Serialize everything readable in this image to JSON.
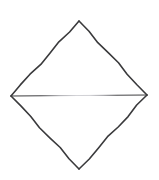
{
  "figure": {
    "shape_name": "rhombus",
    "background_color": "#ffffff",
    "stroke_color_dark": "#3a3a3c",
    "stroke_color_mid": "#8e8e92",
    "stroke_color_light": "#cfcfd3",
    "stroke_width_edge": 1.6,
    "stroke_width_diagonal": 1.2,
    "canvas": {
      "width": 159,
      "height": 180
    },
    "vertices": {
      "top": {
        "label": "top vertex",
        "x": 79,
        "y": 21
      },
      "right": {
        "label": "right vertex",
        "x": 147,
        "y": 95
      },
      "bottom": {
        "label": "bottom vertex",
        "x": 79,
        "y": 169
      },
      "left": {
        "label": "left vertex",
        "x": 11,
        "y": 96
      },
      "center": {
        "label": "diagonal intersection",
        "x": 79,
        "y": 95
      }
    },
    "edges": [
      {
        "name": "top-left-edge",
        "from": "top",
        "to": "left",
        "shade": "dark"
      },
      {
        "name": "top-right-edge",
        "from": "top",
        "to": "right",
        "shade": "dark"
      },
      {
        "name": "bottom-right-edge",
        "from": "right",
        "to": "bottom",
        "shade": "dark"
      },
      {
        "name": "bottom-left-edge",
        "from": "bottom",
        "to": "left",
        "shade": "dark"
      }
    ],
    "diagonals": [
      {
        "name": "vertical-diagonal",
        "from": "top",
        "to": "bottom",
        "shade": "faded-center"
      },
      {
        "name": "horizontal-diagonal",
        "from": "left",
        "to": "right",
        "shade": "faded-center"
      }
    ]
  }
}
